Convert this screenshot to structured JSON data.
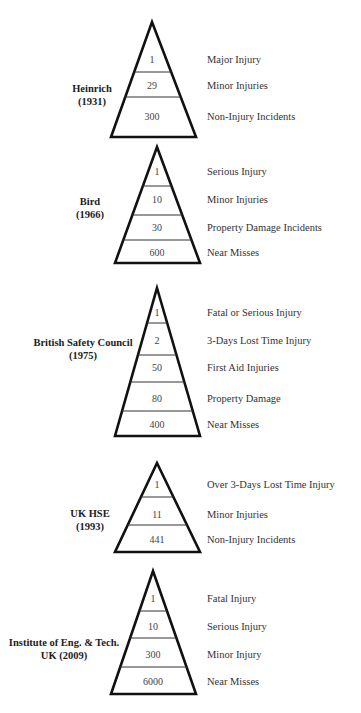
{
  "colors": {
    "line": "#111111",
    "text": "#333333",
    "background": "#ffffff"
  },
  "chart_data": {
    "type": "pyramid",
    "title": "",
    "models": [
      {
        "name": "Heinrich",
        "year": "(1931)",
        "tiers": [
          {
            "value": "1",
            "label": "Major Injury"
          },
          {
            "value": "29",
            "label": "Minor Injuries"
          },
          {
            "value": "300",
            "label": "Non-Injury Incidents"
          }
        ]
      },
      {
        "name": "Bird",
        "year": "(1966)",
        "tiers": [
          {
            "value": "1",
            "label": "Serious Injury"
          },
          {
            "value": "10",
            "label": "Minor Injuries"
          },
          {
            "value": "30",
            "label": "Property Damage Incidents"
          },
          {
            "value": "600",
            "label": "Near Misses"
          }
        ]
      },
      {
        "name": "British Safety Council",
        "year": "(1975)",
        "tiers": [
          {
            "value": "1",
            "label": "Fatal or Serious Injury"
          },
          {
            "value": "2",
            "label": "3-Days Lost Time Injury"
          },
          {
            "value": "50",
            "label": "First Aid Injuries"
          },
          {
            "value": "80",
            "label": "Property Damage"
          },
          {
            "value": "400",
            "label": "Near Misses"
          }
        ]
      },
      {
        "name": "UK HSE",
        "year": "(1993)",
        "tiers": [
          {
            "value": "1",
            "label": "Over 3-Days Lost Time Injury"
          },
          {
            "value": "11",
            "label": "Minor Injuries"
          },
          {
            "value": "441",
            "label": "Non-Injury Incidents"
          }
        ]
      },
      {
        "name": "Institute of Eng. & Tech.",
        "year": "UK (2009)",
        "tiers": [
          {
            "value": "1",
            "label": "Fatal Injury"
          },
          {
            "value": "10",
            "label": "Serious Injury"
          },
          {
            "value": "300",
            "label": "Minor Injury"
          },
          {
            "value": "6000",
            "label": "Near Misses"
          }
        ]
      }
    ]
  },
  "layout": {
    "pyramids": [
      {
        "apex": [
          152,
          22
        ],
        "base_y": 137,
        "base_left": 111,
        "base_right": 196,
        "dividers": [
          72,
          97
        ],
        "value_y": [
          60,
          86,
          117
        ],
        "label_y": [
          60,
          86,
          117
        ],
        "title_x": 92,
        "title_y": 82
      },
      {
        "apex": [
          157,
          147
        ],
        "base_y": 263,
        "base_left": 115,
        "base_right": 200,
        "dividers": [
          186,
          215,
          240
        ],
        "value_y": [
          172,
          200,
          228,
          253
        ],
        "label_y": [
          172,
          200,
          228,
          253
        ],
        "title_x": 90,
        "title_y": 195
      },
      {
        "apex": [
          157,
          288
        ],
        "base_y": 436,
        "base_left": 115,
        "base_right": 200,
        "dividers": [
          323,
          355,
          382,
          411
        ],
        "value_y": [
          313,
          341,
          368,
          399,
          425
        ],
        "label_y": [
          313,
          341,
          368,
          399,
          425
        ],
        "title_x": 83,
        "title_y": 336
      },
      {
        "apex": [
          157,
          463
        ],
        "base_y": 552,
        "base_left": 115,
        "base_right": 200,
        "dividers": [
          497,
          525
        ],
        "value_y": [
          485,
          515,
          540
        ],
        "label_y": [
          485,
          515,
          540
        ],
        "title_x": 90,
        "title_y": 507
      },
      {
        "apex": [
          153,
          571
        ],
        "base_y": 694,
        "base_left": 111,
        "base_right": 196,
        "dividers": [
          611,
          638,
          667
        ],
        "value_y": [
          599,
          627,
          655,
          682
        ],
        "label_y": [
          599,
          627,
          655,
          682
        ],
        "title_x": 64,
        "title_y": 636
      }
    ],
    "label_x": 207
  }
}
